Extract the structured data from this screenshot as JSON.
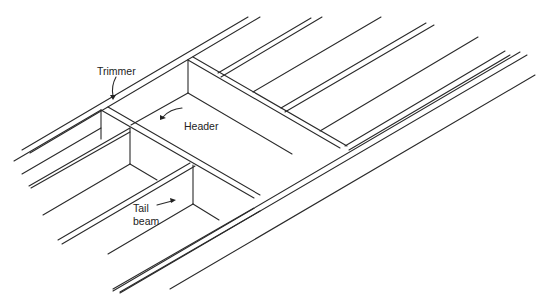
{
  "diagram": {
    "type": "isometric floor framing drawing",
    "stroke_color": "#2a2a2a",
    "background": "#ffffff",
    "labels": {
      "trimmer": "Trimmer",
      "header": "Header",
      "tail_beam_line1": "Tail",
      "tail_beam_line2": "beam"
    }
  }
}
